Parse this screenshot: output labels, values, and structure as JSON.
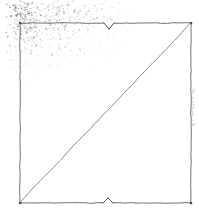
{
  "figure": {
    "description": "Faded scanned line drawing of a square outline with a single diagonal line running from the lower-left corner to the upper-right corner.",
    "background_color": "#ffffff",
    "ink_color": "#6e6e6e",
    "ink_color_dark": "#4a4a4a",
    "noise_color": "#8a8a8a"
  },
  "canvas": {
    "width": 199,
    "height": 220
  },
  "square": {
    "name": "square-outline",
    "left": 20,
    "top": 23,
    "right": 191,
    "bottom": 203,
    "width": 171,
    "height": 180,
    "stroke_width": 1,
    "stroke_color": "#707070"
  },
  "diagonal": {
    "name": "diagonal-line",
    "from_x": 20,
    "from_y": 202,
    "to_x": 190,
    "to_y": 24,
    "stroke_width": 1,
    "stroke_color": "#8c8c8c",
    "direction": "bottom-left to top-right"
  },
  "notches": [
    {
      "name": "top-center-notch",
      "edge": "top",
      "center_x": 109,
      "edge_y": 23,
      "depth": 6,
      "half_width": 5,
      "points_toward": "inside"
    },
    {
      "name": "bottom-center-notch",
      "edge": "bottom",
      "center_x": 108,
      "edge_y": 203,
      "depth": 5,
      "half_width": 5,
      "points_toward": "inside"
    }
  ],
  "stipple": {
    "name": "corner-stipple-noise",
    "location": "upper-left",
    "origin_x": 12,
    "origin_y": 6,
    "spread_x": 130,
    "spread_y": 88,
    "dot_count": 2600,
    "max_opacity": 0.55,
    "color": "#7d7d7d"
  },
  "edge_mark": {
    "name": "right-edge-faint-mark",
    "legible": false,
    "text": "",
    "x": 192,
    "y_top": 88,
    "y_bottom": 126,
    "orientation": "vertical",
    "opacity": 0.32,
    "color": "#909090"
  }
}
